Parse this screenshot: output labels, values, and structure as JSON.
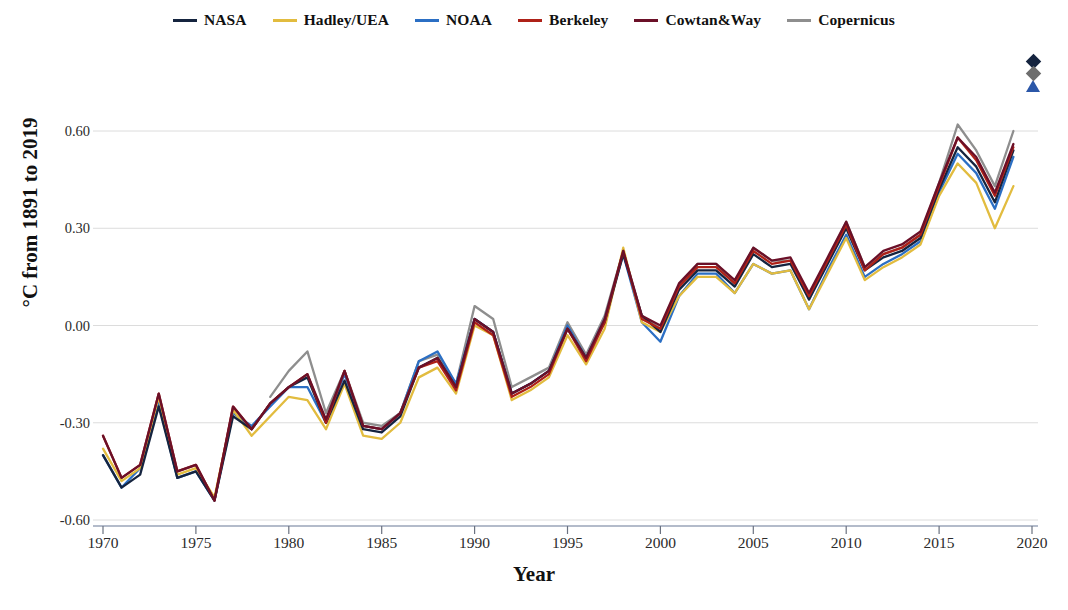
{
  "legend": {
    "position": "top-center",
    "entries": [
      {
        "label": "NASA",
        "color": "#15243f"
      },
      {
        "label": "Hadley/UEA",
        "color": "#e2bc3f"
      },
      {
        "label": "NOAA",
        "color": "#2b6fc4"
      },
      {
        "label": "Berkeley",
        "color": "#ae2118"
      },
      {
        "label": "Cowtan&Way",
        "color": "#6b1028"
      },
      {
        "label": "Copernicus",
        "color": "#8e8e8e"
      }
    ]
  },
  "marker_key": {
    "items": [
      {
        "name": "diamond-dark",
        "shape": "diamond",
        "color": "#15243f"
      },
      {
        "name": "diamond-gray",
        "shape": "diamond",
        "color": "#6e6e6e"
      },
      {
        "name": "triangle-blue",
        "shape": "triangle",
        "color": "#2b57a8"
      }
    ]
  },
  "axes": {
    "x_title": "Year",
    "y_title": "°C from 1891 to 2019",
    "x_ticks": [
      "1970",
      "1975",
      "1980",
      "1985",
      "1990",
      "1995",
      "2000",
      "2005",
      "2010",
      "2015",
      "2020"
    ],
    "y_ticks": [
      "0.60",
      "0.30",
      "0.00",
      "-0.30",
      "-0.60"
    ]
  },
  "chart_data": {
    "type": "line",
    "title": "",
    "xlabel": "Year",
    "ylabel": "°C from 1891 to 2019",
    "xlim": [
      1970,
      2020
    ],
    "ylim": [
      -0.6,
      0.6
    ],
    "grid": true,
    "legend_position": "top-center",
    "x": [
      1970,
      1971,
      1972,
      1973,
      1974,
      1975,
      1976,
      1977,
      1978,
      1979,
      1980,
      1981,
      1982,
      1983,
      1984,
      1985,
      1986,
      1987,
      1988,
      1989,
      1990,
      1991,
      1992,
      1993,
      1994,
      1995,
      1996,
      1997,
      1998,
      1999,
      2000,
      2001,
      2002,
      2003,
      2004,
      2005,
      2006,
      2007,
      2008,
      2009,
      2010,
      2011,
      2012,
      2013,
      2014,
      2015,
      2016,
      2017,
      2018,
      2019
    ],
    "series": [
      {
        "name": "NASA",
        "color": "#15243f",
        "values": [
          -0.4,
          -0.5,
          -0.46,
          -0.25,
          -0.47,
          -0.45,
          -0.54,
          -0.28,
          -0.32,
          -0.24,
          -0.19,
          -0.16,
          -0.3,
          -0.17,
          -0.32,
          -0.33,
          -0.28,
          -0.13,
          -0.1,
          -0.19,
          0.02,
          -0.02,
          -0.21,
          -0.18,
          -0.14,
          -0.01,
          -0.1,
          0.01,
          0.22,
          0.03,
          -0.02,
          0.11,
          0.17,
          0.17,
          0.12,
          0.22,
          0.18,
          0.19,
          0.08,
          0.19,
          0.3,
          0.17,
          0.21,
          0.23,
          0.27,
          0.42,
          0.55,
          0.49,
          0.38,
          0.54
        ]
      },
      {
        "name": "Hadley/UEA",
        "color": "#e2bc3f",
        "values": [
          -0.38,
          -0.48,
          -0.44,
          -0.22,
          -0.46,
          -0.44,
          -0.53,
          -0.26,
          -0.34,
          -0.28,
          -0.22,
          -0.23,
          -0.32,
          -0.18,
          -0.34,
          -0.35,
          -0.3,
          -0.16,
          -0.13,
          -0.21,
          0.0,
          -0.03,
          -0.23,
          -0.2,
          -0.16,
          -0.03,
          -0.12,
          -0.01,
          0.24,
          0.01,
          -0.02,
          0.09,
          0.15,
          0.15,
          0.1,
          0.19,
          0.16,
          0.17,
          0.05,
          0.16,
          0.27,
          0.14,
          0.18,
          0.21,
          0.25,
          0.4,
          0.5,
          0.44,
          0.3,
          0.43
        ]
      },
      {
        "name": "NOAA",
        "color": "#2b6fc4",
        "values": [
          -0.4,
          -0.5,
          -0.44,
          -0.24,
          -0.47,
          -0.45,
          -0.54,
          -0.27,
          -0.31,
          -0.25,
          -0.19,
          -0.19,
          -0.3,
          -0.15,
          -0.31,
          -0.32,
          -0.27,
          -0.11,
          -0.08,
          -0.18,
          0.02,
          -0.02,
          -0.21,
          -0.18,
          -0.14,
          0.0,
          -0.1,
          0.02,
          0.22,
          0.01,
          -0.05,
          0.09,
          0.16,
          0.16,
          0.1,
          0.19,
          0.16,
          0.17,
          0.05,
          0.17,
          0.28,
          0.15,
          0.19,
          0.22,
          0.26,
          0.41,
          0.53,
          0.47,
          0.36,
          0.52
        ]
      },
      {
        "name": "Berkeley",
        "color": "#ae2118",
        "values": [
          -0.34,
          -0.47,
          -0.43,
          -0.21,
          -0.45,
          -0.43,
          -0.54,
          -0.25,
          -0.32,
          -0.24,
          -0.19,
          -0.15,
          -0.3,
          -0.14,
          -0.31,
          -0.32,
          -0.27,
          -0.13,
          -0.11,
          -0.2,
          0.01,
          -0.03,
          -0.22,
          -0.19,
          -0.15,
          -0.01,
          -0.11,
          0.01,
          0.23,
          0.02,
          -0.01,
          0.12,
          0.18,
          0.18,
          0.13,
          0.23,
          0.19,
          0.2,
          0.09,
          0.2,
          0.31,
          0.17,
          0.22,
          0.24,
          0.28,
          0.43,
          0.58,
          0.51,
          0.4,
          0.55
        ]
      },
      {
        "name": "Cowtan&Way",
        "color": "#6b1028",
        "values": [
          -0.34,
          -0.47,
          -0.43,
          -0.21,
          -0.45,
          -0.43,
          -0.54,
          -0.25,
          -0.32,
          -0.24,
          -0.19,
          -0.15,
          -0.29,
          -0.14,
          -0.31,
          -0.32,
          -0.27,
          -0.13,
          -0.1,
          -0.19,
          0.02,
          -0.02,
          -0.21,
          -0.18,
          -0.14,
          -0.01,
          -0.1,
          0.02,
          0.23,
          0.03,
          0.0,
          0.13,
          0.19,
          0.19,
          0.14,
          0.24,
          0.2,
          0.21,
          0.1,
          0.21,
          0.32,
          0.18,
          0.23,
          0.25,
          0.29,
          0.44,
          0.58,
          0.52,
          0.41,
          0.56
        ]
      },
      {
        "name": "Copernicus",
        "color": "#8e8e8e",
        "values": [
          null,
          null,
          null,
          null,
          null,
          null,
          null,
          null,
          null,
          -0.22,
          -0.14,
          -0.08,
          -0.27,
          -0.14,
          -0.3,
          -0.31,
          -0.27,
          -0.11,
          -0.09,
          -0.18,
          0.06,
          0.02,
          -0.19,
          -0.16,
          -0.13,
          0.01,
          -0.09,
          0.03,
          0.23,
          0.03,
          -0.01,
          0.12,
          0.19,
          0.19,
          0.13,
          0.24,
          0.2,
          0.2,
          0.08,
          0.2,
          0.32,
          0.18,
          0.22,
          0.24,
          0.28,
          0.44,
          0.62,
          0.54,
          0.43,
          0.6
        ]
      }
    ]
  }
}
